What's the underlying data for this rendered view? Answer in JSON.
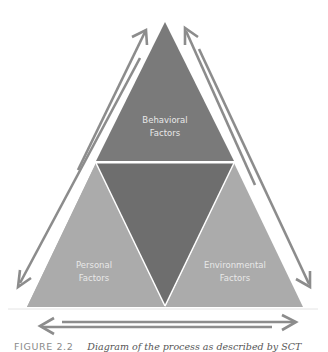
{
  "diagram": {
    "nodes": [
      {
        "id": "behavioral",
        "label_line1": "Behavioral",
        "label_line2": "Factors",
        "position": "top"
      },
      {
        "id": "personal",
        "label_line1": "Personal",
        "label_line2": "Factors",
        "position": "bottom-left"
      },
      {
        "id": "environmental",
        "label_line1": "Environmental",
        "label_line2": "Factors",
        "position": "bottom-right"
      }
    ],
    "edges": [
      {
        "from": "personal",
        "to": "behavioral",
        "style": "bidirectional double arrow",
        "side": "left"
      },
      {
        "from": "behavioral",
        "to": "environmental",
        "style": "bidirectional double arrow",
        "side": "right"
      },
      {
        "from": "personal",
        "to": "environmental",
        "style": "bidirectional double arrow",
        "side": "bottom"
      }
    ],
    "colors": {
      "top_triangle": "#7a7a7a",
      "center_inverted_triangle": "#6e6e6e",
      "bottom_triangles": "#ababab",
      "arrows": "#8c8c8c",
      "label_text": "#e8e8e8",
      "divider": "#ffffff"
    }
  },
  "caption": {
    "figure_number": "FIGURE 2.2",
    "text": "Diagram of the process as described by SCT"
  }
}
